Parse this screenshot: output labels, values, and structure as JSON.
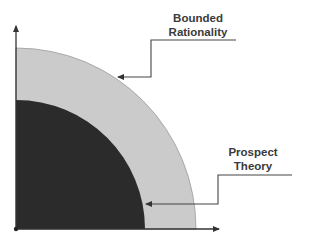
{
  "diagram": {
    "type": "nested-quarter-circles",
    "colors": {
      "background": "#ffffff",
      "outer_region": "#cbcbcb",
      "inner_region": "#2b2b2b",
      "axis": "#333333",
      "leader_line": "#444444",
      "label_text": "#3a3a3a"
    },
    "axes": {
      "x_axis": {
        "label": "",
        "direction": "right"
      },
      "y_axis": {
        "label": "",
        "direction": "up"
      }
    },
    "regions": [
      {
        "name": "Bounded Rationality",
        "layer": "outer",
        "color": "#cbcbcb"
      },
      {
        "name": "Prospect Theory",
        "layer": "inner",
        "color": "#2b2b2b"
      }
    ],
    "labels": {
      "bounded_rationality": {
        "line1": "Bounded",
        "line2": "Rationality"
      },
      "prospect_theory": {
        "line1": "Prospect",
        "line2": "Theory"
      }
    }
  }
}
